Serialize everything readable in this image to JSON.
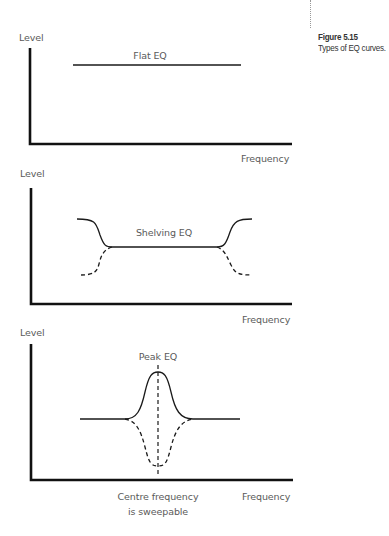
{
  "figure": {
    "number": "Figure 5.15",
    "caption": "Types of EQ curves."
  },
  "panels": [
    {
      "title": "Flat EQ",
      "y_axis_label": "Level",
      "x_axis_label": "Frequency"
    },
    {
      "title": "Shelving EQ",
      "y_axis_label": "Level",
      "x_axis_label": "Frequency"
    },
    {
      "title": "Peak EQ",
      "y_axis_label": "Level",
      "x_axis_label": "Frequency",
      "annotation_line1": "Centre frequency",
      "annotation_line2": "is sweepable"
    }
  ],
  "colors": {
    "axis": "#111111",
    "curve": "#1a1a1a",
    "label": "#5a5a5a"
  }
}
